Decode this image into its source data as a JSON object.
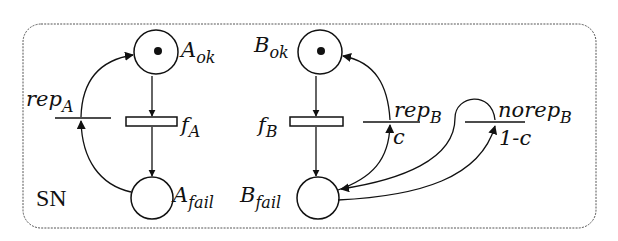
{
  "diagram": {
    "net_label": "SN",
    "colors": {
      "stroke": "#111111",
      "background": "#ffffff",
      "border": "#444444"
    },
    "places": [
      {
        "id": "A_ok",
        "base": "A",
        "sub": "ok",
        "token": true
      },
      {
        "id": "A_fail",
        "base": "A",
        "sub": "fail",
        "token": false
      },
      {
        "id": "B_ok",
        "base": "B",
        "sub": "ok",
        "token": true
      },
      {
        "id": "B_fail",
        "base": "B",
        "sub": "fail",
        "token": false
      }
    ],
    "transitions": [
      {
        "id": "f_A",
        "base": "f",
        "sub": "A",
        "kind": "timed"
      },
      {
        "id": "rep_A",
        "base": "rep",
        "sub": "A",
        "kind": "immediate"
      },
      {
        "id": "f_B",
        "base": "f",
        "sub": "B",
        "kind": "timed"
      },
      {
        "id": "rep_B",
        "base": "rep",
        "sub": "B",
        "kind": "immediate",
        "weight": "c"
      },
      {
        "id": "norep_B",
        "base": "norep",
        "sub": "B",
        "kind": "immediate",
        "weight": "1-c"
      }
    ]
  }
}
